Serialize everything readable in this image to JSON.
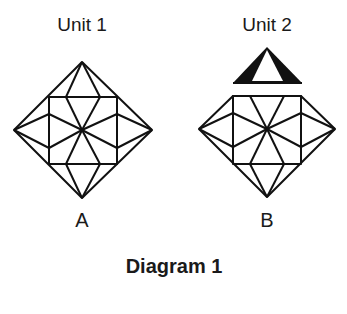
{
  "units": [
    {
      "title": "Unit 1",
      "letter": "A",
      "cx": 82
    },
    {
      "title": "Unit 2",
      "letter": "B",
      "cx": 267
    }
  ],
  "caption": "Diagram 1",
  "colors": {
    "stroke": "#111111",
    "background": "#ffffff"
  }
}
